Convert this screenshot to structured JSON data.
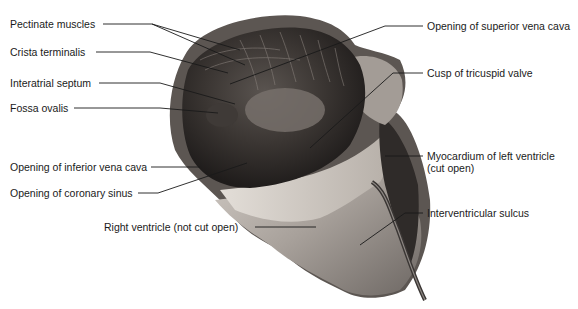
{
  "figure": {
    "colors": {
      "background": "#ffffff",
      "specimen_dark": "#2e2a28",
      "specimen_mid": "#6b6460",
      "specimen_light": "#c9c3bd",
      "leader_line": "#1a1a1a",
      "label_text": "#1a1a1a"
    }
  },
  "labels": {
    "left": [
      {
        "text": "Pectinate muscles"
      },
      {
        "text": "Crista terminalis"
      },
      {
        "text": "Interatrial septum"
      },
      {
        "text": "Fossa ovalis"
      },
      {
        "text": "Opening of inferior vena cava"
      },
      {
        "text": "Opening of coronary sinus"
      },
      {
        "text": "Right ventricle (not cut open)"
      }
    ],
    "right": [
      {
        "text": "Opening of superior vena cava"
      },
      {
        "text": "Cusp of tricuspid valve"
      },
      {
        "text": "Myocardium of left ventricle"
      },
      {
        "text": "(cut open)"
      },
      {
        "text": "Interventricular sulcus"
      }
    ]
  }
}
